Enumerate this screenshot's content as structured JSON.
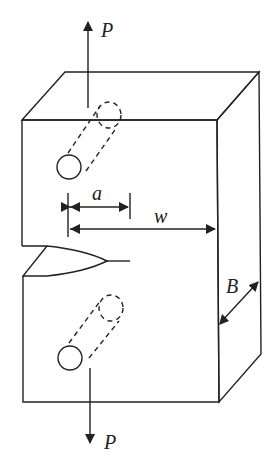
{
  "diagram": {
    "labels": {
      "load_top": "P",
      "load_bottom": "P",
      "crack_length": "a",
      "width": "w",
      "thickness": "B"
    },
    "colors": {
      "stroke": "#222222",
      "background": "#ffffff"
    }
  }
}
